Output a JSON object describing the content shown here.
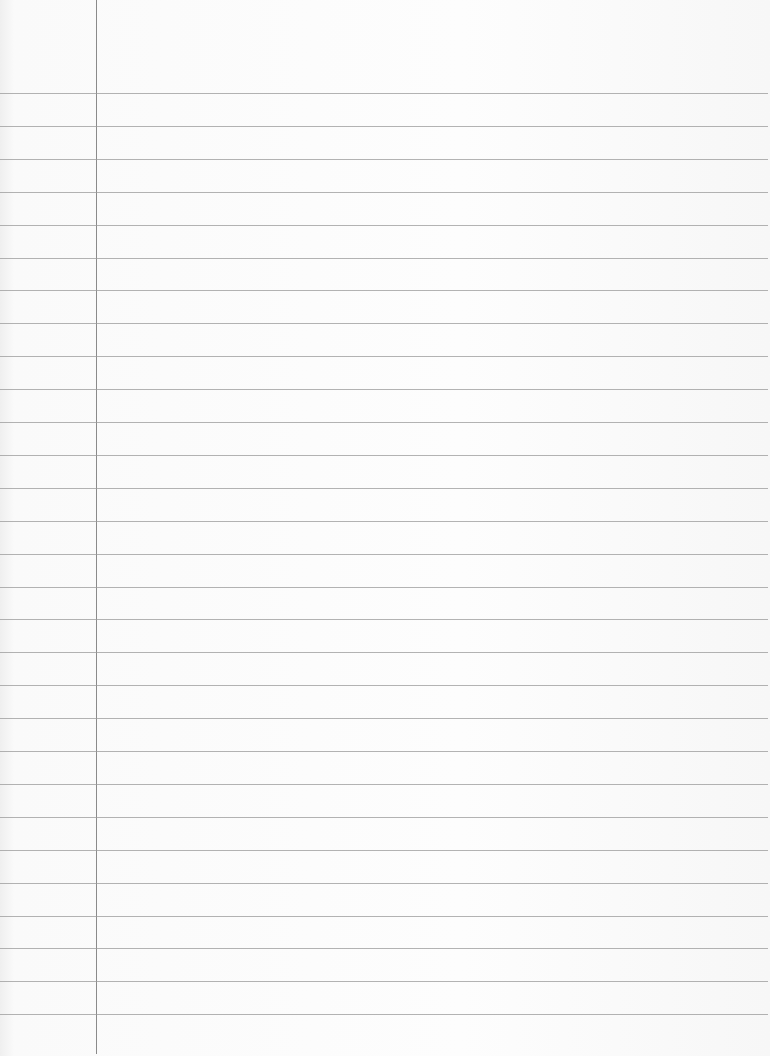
{
  "page": {
    "type": "blank lined notebook paper",
    "background_color": "#fbfbfb",
    "rule_color": "#9a9a9a",
    "margin_color": "#8a8a8a",
    "margin_x": 96,
    "first_rule_y": 93,
    "rule_spacing": 32.9,
    "rule_count": 29
  }
}
